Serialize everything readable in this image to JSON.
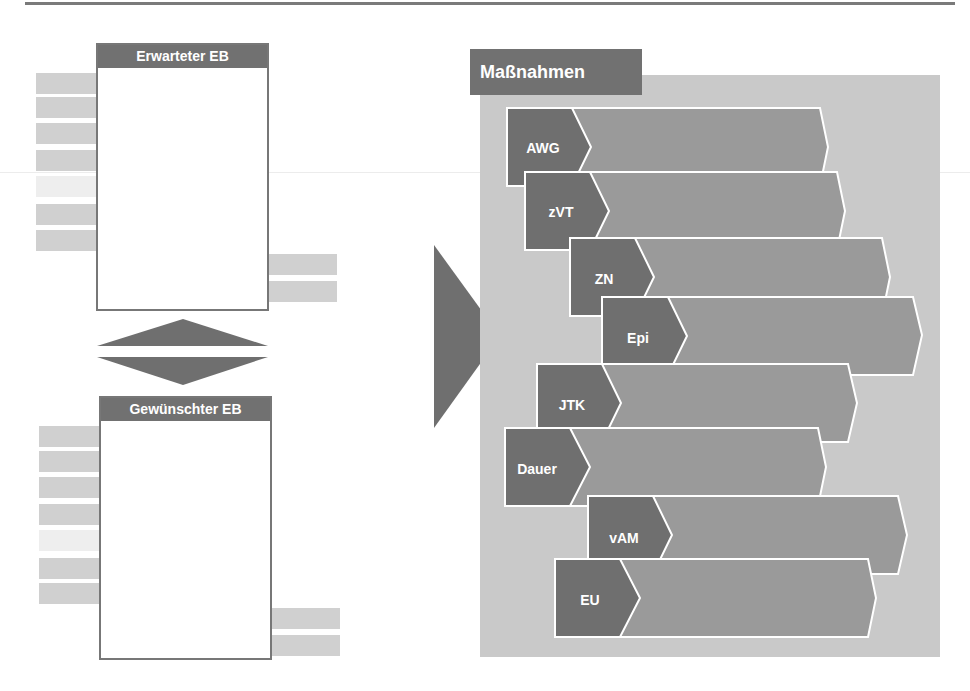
{
  "left": {
    "expected_box": {
      "title": "Erwarteter EB"
    },
    "desired_box": {
      "title": "Gewünschter EB"
    }
  },
  "measures": {
    "title": "Maßnahmen",
    "items": [
      {
        "label": "AWG"
      },
      {
        "label": "zVT"
      },
      {
        "label": "ZN"
      },
      {
        "label": "Epi"
      },
      {
        "label": "JTK"
      },
      {
        "label": "Dauer"
      },
      {
        "label": "vAM"
      },
      {
        "label": "EU"
      }
    ]
  },
  "colors": {
    "dark_gray": "#6f6f6f",
    "mid_gray": "#9a9a9a",
    "panel_gray": "#c9c9c9",
    "bar_gray": "#d0d0d0",
    "stroke_white": "#ffffff"
  }
}
